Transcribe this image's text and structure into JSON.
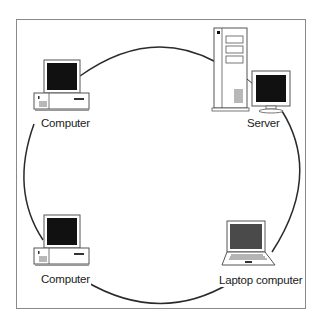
{
  "diagram": {
    "type": "ring-network",
    "title": "",
    "nodes": [
      {
        "id": "computer-top-left",
        "label": "Computer",
        "icon": "desktop-computer-icon"
      },
      {
        "id": "server",
        "label": "Server",
        "icon": "server-tower-icon"
      },
      {
        "id": "laptop",
        "label": "Laptop computer",
        "icon": "laptop-icon"
      },
      {
        "id": "computer-bottom-left",
        "label": "Computer",
        "icon": "desktop-computer-icon"
      }
    ],
    "edges": [
      {
        "from": "computer-top-left",
        "to": "server"
      },
      {
        "from": "server",
        "to": "laptop"
      },
      {
        "from": "laptop",
        "to": "computer-bottom-left"
      },
      {
        "from": "computer-bottom-left",
        "to": "computer-top-left"
      }
    ],
    "colors": {
      "frame": "#8a8a8a",
      "ring": "#2a2a2a",
      "screen": "#111111",
      "laptop_screen": "#4a4a4a"
    }
  }
}
